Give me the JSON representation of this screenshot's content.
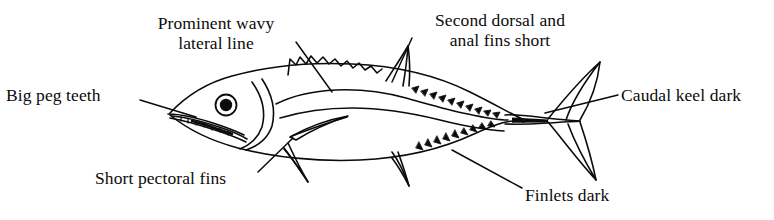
{
  "figure": {
    "ink_color": "#0b0b0b",
    "background_color": "#ffffff",
    "width": 774,
    "height": 220
  },
  "labels": [
    {
      "id": "lateral-line",
      "text": "Prominent wavy\nlateral line",
      "align": "center",
      "leader": {
        "from_x": 296,
        "from_y": 42,
        "to_x": 332,
        "to_y": 92
      }
    },
    {
      "id": "second-dorsal",
      "text": "Second dorsal and\nanal fins short",
      "align": "center",
      "leader": {
        "from_x": 412,
        "from_y": 38,
        "to_x": 392,
        "to_y": 82
      }
    },
    {
      "id": "big-peg-teeth",
      "text": "Big peg teeth",
      "align": "left",
      "leader": {
        "from_x": 140,
        "from_y": 100,
        "to_x": 196,
        "to_y": 117
      }
    },
    {
      "id": "caudal-keel",
      "text": "Caudal keel dark",
      "align": "left",
      "leader": {
        "from_x": 618,
        "from_y": 95,
        "to_x": 545,
        "to_y": 113
      }
    },
    {
      "id": "short-pectoral-fins",
      "text": "Short pectoral fins",
      "align": "left",
      "leader": {
        "from_x": 258,
        "from_y": 172,
        "to_x": 293,
        "to_y": 138
      }
    },
    {
      "id": "finlets-dark",
      "text": "Finlets dark",
      "align": "left",
      "leader": {
        "from_x": 522,
        "from_y": 188,
        "to_x": 452,
        "to_y": 150
      }
    }
  ],
  "anatomy_parts": [
    "body-outline",
    "head-gill-line",
    "eye",
    "mouth-jaw",
    "peg-teeth",
    "lateral-line",
    "first-dorsal-fin",
    "second-dorsal-fin",
    "anal-fin",
    "pectoral-fin",
    "pelvic-fin",
    "dorsal-finlets",
    "ventral-finlets",
    "caudal-keel",
    "caudal-fin"
  ]
}
